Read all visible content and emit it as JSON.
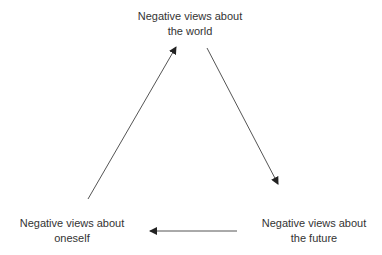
{
  "diagram": {
    "title": "",
    "type": "cycle",
    "nodes": [
      {
        "id": "world",
        "line1": "Negative views about",
        "line2": "the world"
      },
      {
        "id": "future",
        "line1": "Negative views about",
        "line2": "the future"
      },
      {
        "id": "self",
        "line1": "Negative views about",
        "line2": "oneself"
      }
    ],
    "edges": [
      {
        "from": "world",
        "to": "future"
      },
      {
        "from": "future",
        "to": "self"
      },
      {
        "from": "self",
        "to": "world"
      }
    ],
    "colors": {
      "text": "#333333",
      "arrow": "#555555",
      "background": "#ffffff"
    }
  }
}
